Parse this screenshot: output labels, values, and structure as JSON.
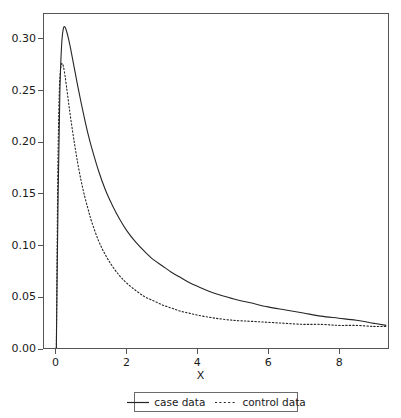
{
  "chart_data": {
    "type": "line",
    "title": "",
    "xlabel": "X",
    "ylabel": "",
    "xlim": [
      -0.35,
      9.4
    ],
    "ylim": [
      0.0,
      0.325
    ],
    "grid": false,
    "legend_position": "bottom",
    "xticks": [
      0,
      2,
      4,
      6,
      8
    ],
    "xtick_labels": [
      "0",
      "2",
      "4",
      "6",
      "8"
    ],
    "yticks": [
      0.0,
      0.05,
      0.1,
      0.15,
      0.2,
      0.25,
      0.3
    ],
    "ytick_labels": [
      "0.00",
      "0.05",
      "0.10",
      "0.15",
      "0.20",
      "0.25",
      "0.30"
    ],
    "series": [
      {
        "name": "case data",
        "style": "solid",
        "color": "#262626",
        "x": [
          0.0,
          0.05,
          0.1,
          0.15,
          0.2,
          0.25,
          0.3,
          0.35,
          0.4,
          0.5,
          0.6,
          0.7,
          0.8,
          0.9,
          1.0,
          1.2,
          1.4,
          1.6,
          1.8,
          2.0,
          2.25,
          2.5,
          2.75,
          3.0,
          3.25,
          3.5,
          3.75,
          4.0,
          4.5,
          5.0,
          5.5,
          6.0,
          6.5,
          7.0,
          7.5,
          8.0,
          8.5,
          9.0,
          9.35
        ],
        "y": [
          0.0,
          0.148,
          0.249,
          0.295,
          0.311,
          0.312,
          0.307,
          0.3,
          0.292,
          0.274,
          0.256,
          0.239,
          0.223,
          0.208,
          0.195,
          0.172,
          0.153,
          0.138,
          0.125,
          0.114,
          0.103,
          0.094,
          0.086,
          0.08,
          0.074,
          0.069,
          0.064,
          0.06,
          0.053,
          0.048,
          0.044,
          0.04,
          0.037,
          0.034,
          0.031,
          0.029,
          0.027,
          0.024,
          0.022
        ]
      },
      {
        "name": "control data",
        "style": "dotted",
        "color": "#262626",
        "x": [
          0.0,
          0.04,
          0.08,
          0.12,
          0.16,
          0.2,
          0.25,
          0.3,
          0.35,
          0.4,
          0.5,
          0.6,
          0.7,
          0.8,
          0.9,
          1.0,
          1.2,
          1.4,
          1.6,
          1.8,
          2.0,
          2.25,
          2.5,
          2.75,
          3.0,
          3.25,
          3.5,
          3.75,
          4.0,
          4.5,
          5.0,
          5.5,
          6.0,
          6.5,
          7.0,
          7.5,
          8.0,
          8.5,
          9.0,
          9.35
        ],
        "y": [
          0.0,
          0.165,
          0.245,
          0.271,
          0.277,
          0.274,
          0.264,
          0.251,
          0.238,
          0.225,
          0.202,
          0.181,
          0.163,
          0.148,
          0.135,
          0.123,
          0.104,
          0.09,
          0.079,
          0.07,
          0.063,
          0.056,
          0.05,
          0.046,
          0.042,
          0.039,
          0.036,
          0.034,
          0.032,
          0.029,
          0.027,
          0.026,
          0.025,
          0.024,
          0.023,
          0.023,
          0.022,
          0.022,
          0.021,
          0.021
        ]
      }
    ]
  },
  "legend": {
    "entries": [
      {
        "label": "case data",
        "style": "solid"
      },
      {
        "label": "control data",
        "style": "dotted"
      }
    ]
  },
  "axes": {
    "x_title": "X"
  },
  "colors": {
    "line": "#262626",
    "frame": "#555555",
    "background": "#ffffff",
    "text": "#1a1a1a"
  }
}
